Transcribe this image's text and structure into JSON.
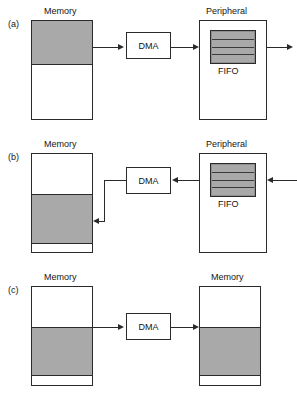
{
  "figure": {
    "title": "",
    "panels": [
      {
        "tag": "(a)",
        "description": "Memory to peripheral FIFO DMA transfer",
        "left_box_label": "Memory",
        "right_box_label": "Peripheral",
        "dma_label": "DMA",
        "fifo_label": "FIFO",
        "fifo_rows": 4,
        "memory_fill": "top",
        "flow": "left-to-right"
      },
      {
        "tag": "(b)",
        "description": "Peripheral FIFO to memory DMA transfer",
        "left_box_label": "Memory",
        "right_box_label": "Peripheral",
        "dma_label": "DMA",
        "fifo_label": "FIFO",
        "fifo_rows": 4,
        "memory_fill": "middle",
        "flow": "right-to-left"
      },
      {
        "tag": "(c)",
        "description": "Memory to memory DMA transfer",
        "left_box_label": "Memory",
        "right_box_label": "Memory",
        "dma_label": "DMA",
        "memory_fill": "middle",
        "flow": "left-to-right"
      }
    ]
  },
  "colors": {
    "fill_gray": "#a9a9a9",
    "stroke": "#2a2a2a",
    "background": "#ffffff",
    "text": "#151515"
  }
}
